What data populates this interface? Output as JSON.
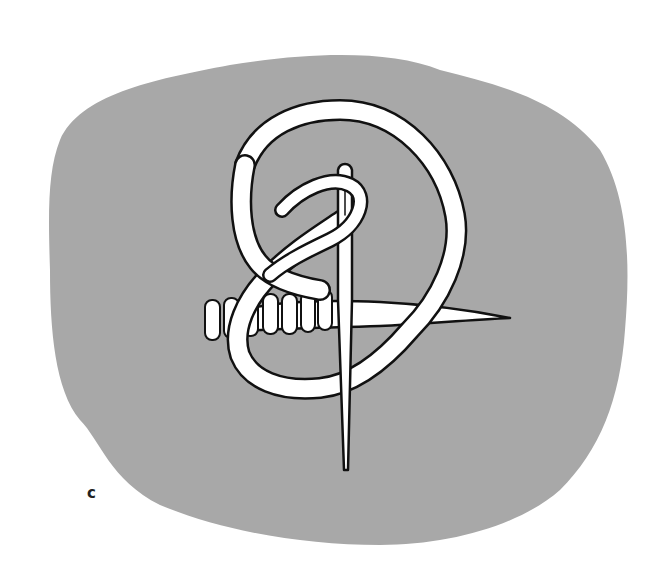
{
  "figure": {
    "label": "c",
    "colors": {
      "background": "#ffffff",
      "blob": "#a8a8a8",
      "outline": "#111111",
      "fill": "#ffffff"
    }
  }
}
